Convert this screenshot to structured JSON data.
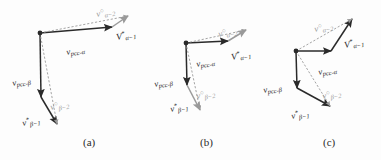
{
  "figure": {
    "kind": "vector-diagram",
    "background_color": "#fdfdfd",
    "dark_color": "#2a2a2a",
    "gray_color": "#9a9a9a",
    "panel_captions": [
      {
        "id": "a",
        "text": "(a)"
      },
      {
        "id": "b",
        "text": "(b)"
      },
      {
        "id": "c",
        "text": "(c)"
      }
    ]
  },
  "labels": {
    "pcc_alpha": {
      "base": "v",
      "sup": "",
      "sub": "pcc-α"
    },
    "pcc_beta": {
      "base": "v",
      "sup": "",
      "sub": "pcc-β"
    },
    "alpha_minus_2": {
      "base": "v",
      "sup": "○",
      "sub": "α−2"
    },
    "alpha_minus_1": {
      "base": "V",
      "sup": "*",
      "sub": "α−1"
    },
    "beta_minus_2": {
      "base": "v",
      "sup": "○",
      "sub": "β−2"
    },
    "beta_minus_1": {
      "base": "v",
      "sup": "*",
      "sub": "β−1"
    }
  },
  "panels": [
    {
      "id": "a",
      "caption": "(a)",
      "caption_x": 83,
      "caption_y": 136,
      "node": {
        "x": 40,
        "y": 33
      },
      "label_positions": {
        "pcc_alpha": {
          "x": 66,
          "y": 42
        },
        "pcc_beta": {
          "x": 12,
          "y": 73
        },
        "alpha_minus_2": {
          "x": 96,
          "y": 4
        },
        "alpha_minus_1": {
          "x": 116,
          "y": 27
        },
        "beta_minus_2": {
          "x": 50,
          "y": 97
        },
        "beta_minus_1": {
          "x": 22,
          "y": 113
        }
      }
    },
    {
      "id": "b",
      "caption": "(b)",
      "caption_x": 200,
      "caption_y": 136,
      "node": {
        "x": 186,
        "y": 43
      },
      "label_positions": {
        "pcc_alpha": {
          "x": 196,
          "y": 54
        },
        "pcc_beta": {
          "x": 154,
          "y": 74
        },
        "alpha_minus_2": {
          "x": 218,
          "y": 24
        },
        "alpha_minus_1": {
          "x": 231,
          "y": 47
        },
        "beta_minus_2": {
          "x": 196,
          "y": 86
        },
        "beta_minus_1": {
          "x": 170,
          "y": 99
        }
      }
    },
    {
      "id": "c",
      "caption": "(c)",
      "caption_x": 323,
      "caption_y": 136,
      "node": {
        "x": 296,
        "y": 51
      },
      "label_positions": {
        "pcc_alpha": {
          "x": 318,
          "y": 62
        },
        "pcc_beta": {
          "x": 263,
          "y": 80
        },
        "alpha_minus_2": {
          "x": 314,
          "y": 19
        },
        "alpha_minus_1": {
          "x": 344,
          "y": 35
        },
        "beta_minus_2": {
          "x": 322,
          "y": 86
        },
        "beta_minus_1": {
          "x": 291,
          "y": 106
        }
      }
    }
  ],
  "vectors": {
    "panel_a": [
      {
        "name": "pcc-alpha-arrow",
        "style": "solid-dark",
        "x1": 40,
        "y1": 33,
        "x2": 112,
        "y2": 27
      },
      {
        "name": "alpha-minus-1-arrow",
        "style": "solid-gray",
        "x1": 112,
        "y1": 27,
        "x2": 128,
        "y2": 16
      },
      {
        "name": "alpha-minus-2-dashed",
        "style": "dashed-gray",
        "x1": 40,
        "y1": 33,
        "x2": 128,
        "y2": 16
      },
      {
        "name": "pcc-beta-arrow",
        "style": "solid-dark",
        "x1": 40,
        "y1": 33,
        "x2": 41,
        "y2": 97
      },
      {
        "name": "beta-minus-1-arrow",
        "style": "solid-dark",
        "x1": 41,
        "y1": 97,
        "x2": 57,
        "y2": 124
      },
      {
        "name": "beta-minus-2-dashed",
        "style": "dashed-gray",
        "x1": 40,
        "y1": 33,
        "x2": 57,
        "y2": 124
      }
    ],
    "panel_b": [
      {
        "name": "pcc-alpha-arrow",
        "style": "solid-dark",
        "x1": 186,
        "y1": 43,
        "x2": 228,
        "y2": 41
      },
      {
        "name": "alpha-minus-1-arrow",
        "style": "solid-gray",
        "x1": 228,
        "y1": 41,
        "x2": 246,
        "y2": 30
      },
      {
        "name": "alpha-minus-2-dashed",
        "style": "dashed-gray",
        "x1": 186,
        "y1": 43,
        "x2": 246,
        "y2": 30
      },
      {
        "name": "pcc-beta-arrow",
        "style": "solid-dark",
        "x1": 186,
        "y1": 43,
        "x2": 187,
        "y2": 85
      },
      {
        "name": "beta-minus-1-arrow",
        "style": "solid-gray",
        "x1": 187,
        "y1": 85,
        "x2": 200,
        "y2": 110
      },
      {
        "name": "beta-minus-2-dashed",
        "style": "dashed-gray",
        "x1": 186,
        "y1": 43,
        "x2": 200,
        "y2": 110
      }
    ],
    "panel_c": [
      {
        "name": "pcc-alpha-arrow",
        "style": "solid-dark",
        "x1": 296,
        "y1": 51,
        "x2": 331,
        "y2": 51
      },
      {
        "name": "alpha-minus-1-arrow",
        "style": "solid-dark",
        "x1": 331,
        "y1": 51,
        "x2": 352,
        "y2": 19
      },
      {
        "name": "alpha-minus-2-dashed",
        "style": "dashed-gray",
        "x1": 296,
        "y1": 51,
        "x2": 352,
        "y2": 19
      },
      {
        "name": "pcc-beta-arrow",
        "style": "solid-dark",
        "x1": 296,
        "y1": 51,
        "x2": 297,
        "y2": 88
      },
      {
        "name": "beta-minus-1-arrow",
        "style": "solid-dark",
        "x1": 297,
        "y1": 88,
        "x2": 330,
        "y2": 106
      },
      {
        "name": "beta-minus-2-dashed",
        "style": "dashed-gray",
        "x1": 296,
        "y1": 51,
        "x2": 330,
        "y2": 106
      }
    ]
  }
}
